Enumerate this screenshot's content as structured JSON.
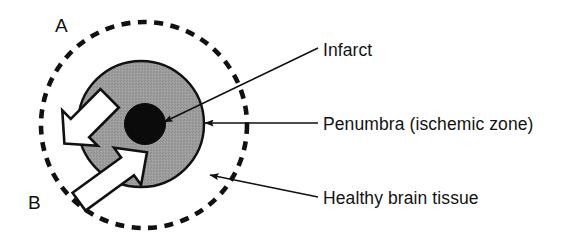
{
  "figure": {
    "background_color": "#ffffff",
    "width": 582,
    "height": 243
  },
  "panel_letters": [
    {
      "id": "A",
      "text": "A",
      "x": 55,
      "y": 16
    },
    {
      "id": "B",
      "text": "B",
      "x": 28,
      "y": 193
    }
  ],
  "regions": {
    "healthy_brain_tissue": {
      "label": "Healthy brain tissue",
      "shape": "dashed-circle",
      "cx": 144,
      "cy": 125,
      "r": 103,
      "stroke_color": "#111111",
      "fill_color": "#ffffff",
      "dash": "9 7",
      "stroke_width": 4.5
    },
    "penumbra": {
      "label": "Penumbra (ischemic zone)",
      "shape": "filled-circle",
      "cx": 141,
      "cy": 124,
      "r": 63,
      "fill_color": "#9a9a9a",
      "stroke_color": "#111111",
      "stroke_width": 2.2
    },
    "infarct": {
      "label": "Infarct",
      "shape": "filled-circle",
      "cx": 145,
      "cy": 124,
      "r": 20,
      "fill_color": "#0b0b0b",
      "stroke_color": "#0b0b0b",
      "stroke_width": 1
    }
  },
  "arrows_white": [
    {
      "name": "arrow-outward-upper-left",
      "direction": "outward",
      "fill_color": "#ffffff",
      "stroke_color": "#111111"
    },
    {
      "name": "arrow-inward-lower-left",
      "direction": "inward",
      "fill_color": "#ffffff",
      "stroke_color": "#111111"
    }
  ],
  "callouts": [
    {
      "id": "infarct",
      "text": "Infarct",
      "label_x": 323,
      "label_y": 42,
      "leader_from": [
        318,
        48
      ],
      "leader_to": [
        160,
        124
      ],
      "leader_style": "diagonal-arrow"
    },
    {
      "id": "penumbra",
      "text": "Penumbra (ischemic zone)",
      "label_x": 323,
      "label_y": 116,
      "leader_from": [
        318,
        123
      ],
      "leader_to": [
        204,
        123
      ],
      "leader_style": "horizontal-arrow"
    },
    {
      "id": "healthy",
      "text": "Healthy brain tissue",
      "label_x": 323,
      "label_y": 190,
      "leader_from": [
        318,
        197
      ],
      "leader_to": [
        208,
        176
      ],
      "leader_style": "diagonal-arrow"
    }
  ],
  "colors": {
    "ink": "#111111",
    "penumbra_gray": "#9a9a9a",
    "infarct_black": "#0b0b0b",
    "paper": "#ffffff"
  }
}
